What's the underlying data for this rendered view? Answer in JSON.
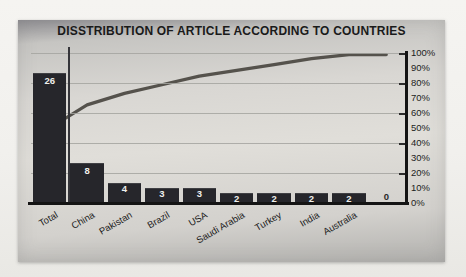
{
  "title": "DISSTRIBUTION OF ARTICLE ACCORDING TO COUNTRIES",
  "chart_data": {
    "type": "bar",
    "subtype": "pareto-combo-bar-line",
    "title": "DISSTRIBUTION OF ARTICLE ACCORDING TO COUNTRIES",
    "categories": [
      "Total",
      "China",
      "Pakistan",
      "Brazil",
      "USA",
      "Saudi Arabia",
      "Turkey",
      "India",
      "Australia",
      ""
    ],
    "series": [
      {
        "name": "article-count-bars",
        "type": "bar",
        "values": [
          26,
          8,
          4,
          3,
          3,
          2,
          2,
          2,
          2,
          0
        ]
      },
      {
        "name": "cumulative-percent-line",
        "type": "line",
        "values": [
          50,
          65.4,
          73.1,
          78.8,
          84.6,
          88.5,
          92.3,
          96.2,
          100,
          100
        ]
      }
    ],
    "bar_data_labels": [
      "26",
      "8",
      "4",
      "3",
      "3",
      "2",
      "2",
      "2",
      "2",
      "0"
    ],
    "bar_axis_max": 30,
    "right_axis_labels": [
      "100%",
      "90%",
      "80%",
      "70%",
      "60%",
      "50%",
      "40%",
      "30%",
      "20%",
      "10%",
      "0%"
    ],
    "right_axis_range": [
      0,
      100
    ],
    "gridlines": "horizontal at every 20% (5 interior lines)",
    "legend": "none",
    "xlabel": "",
    "ylabel": "",
    "colors": {
      "bar": "#26262b",
      "line": "#55524c",
      "axis": "#141414",
      "gridline": "#a5a4a0",
      "title_text": "#1a1a1a",
      "axis_label_text": "#1b1b1b",
      "bar_label_text": "#efefec",
      "chart_background": "#dcdad6",
      "page_background": "#f0efec"
    }
  }
}
